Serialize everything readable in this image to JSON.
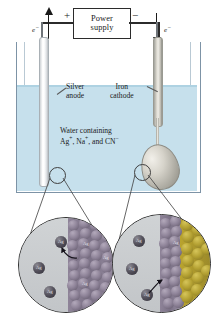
{
  "figure": {
    "background_color": "#ffffff"
  },
  "power_supply": {
    "line1": "Power",
    "line2": "supply",
    "positive_terminal": "+",
    "negative_terminal": "−"
  },
  "electrons": {
    "left_label": "e",
    "left_charge": "−",
    "left_direction": "up",
    "right_label": "e",
    "right_charge": "−",
    "right_direction": "down"
  },
  "electrodes": {
    "anode_line1": "Silver",
    "anode_line2": "anode",
    "cathode_line1": "Iron",
    "cathode_line2": "cathode"
  },
  "solution": {
    "line1": "Water containing",
    "line2_parts": [
      {
        "text": "Ag",
        "sup": "+"
      },
      {
        "text": ", Na",
        "sup": "+"
      },
      {
        "text": ", and CN",
        "sup": "−"
      }
    ],
    "line2_plain": "Ag+, Na+, and CN−",
    "water_color": "#c6e0ec",
    "tank_border_color": "#7d93a6"
  },
  "insets": {
    "left": {
      "name": "silver-anode-detail",
      "description": "Silver atoms leaving the anode surface and entering solution as Ag+ ions",
      "solution_color": "#cdd0d3",
      "lattice_color": "#8e8398",
      "ion_color": "#56535e",
      "ion_label": "Ag",
      "free_ions": [
        {
          "x": 38,
          "y": 20,
          "label": "Ag"
        },
        {
          "x": 16,
          "y": 46,
          "label": "Ag"
        },
        {
          "x": 27,
          "y": 70,
          "label": "Ag"
        }
      ],
      "lattice_labels": [
        "Ag",
        "Ag",
        "Ag"
      ],
      "arrow_direction": "lattice-to-solution"
    },
    "right": {
      "name": "iron-cathode-detail",
      "description": "Ag+ ions from solution depositing as silver atoms onto the iron cathode",
      "solution_color": "#cdd0d3",
      "lattice_color": "#8e8398",
      "ion_color": "#56535e",
      "gold_color": "#b3a032",
      "ion_label": "Ag",
      "free_ions": [
        {
          "x": 22,
          "y": 22,
          "label": "Ag"
        },
        {
          "x": 15,
          "y": 50,
          "label": "Ag"
        },
        {
          "x": 30,
          "y": 76,
          "label": "Ag"
        }
      ],
      "lattice_labels": [
        "Ag"
      ],
      "arrow_direction": "solution-to-lattice"
    }
  }
}
